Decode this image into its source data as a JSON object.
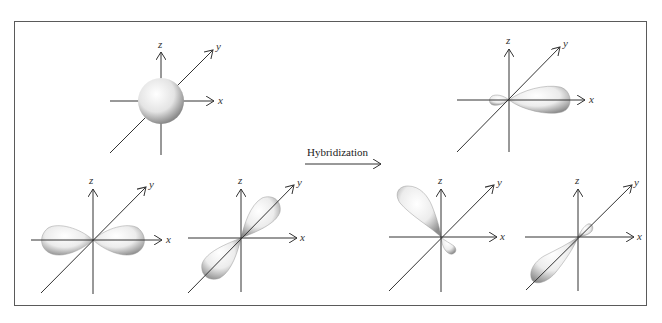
{
  "figure": {
    "title": "",
    "arrow_label": "Hybridization",
    "axis_labels": {
      "x": "x",
      "y": "y",
      "z": "z"
    },
    "colors": {
      "border": "#5a5a5a",
      "axis": "#333333",
      "lobe_light": "#fafafa",
      "lobe_dark": "#9a9a9a"
    },
    "left_group": {
      "description": "Atomic orbitals before hybridization",
      "orbitals": [
        {
          "name": "s orbital",
          "shape": "sphere"
        },
        {
          "name": "px orbital",
          "shape": "dumbbell along x"
        },
        {
          "name": "py orbital",
          "shape": "dumbbell along y"
        }
      ]
    },
    "right_group": {
      "description": "sp2 hybrid orbitals after hybridization",
      "orbitals": [
        {
          "name": "sp2 hybrid 1",
          "shape": "large lobe +x, small lobe -x"
        },
        {
          "name": "sp2 hybrid 2",
          "shape": "large lobe upper-left, small lobe lower-right"
        },
        {
          "name": "sp2 hybrid 3",
          "shape": "large lobe lower-left, small lobe upper-right"
        }
      ]
    }
  }
}
